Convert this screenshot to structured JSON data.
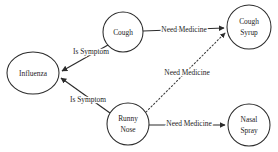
{
  "diagram": {
    "background_color": "#ffffff",
    "stroke_color": "#2b2b2b",
    "text_color": "#1d1d1d",
    "nodes": [
      {
        "id": "influenza",
        "label": "Influenza",
        "shape": "ellipse",
        "cx": 33,
        "cy": 73,
        "rx": 26,
        "ry": 21,
        "lines": [
          "Influenza"
        ]
      },
      {
        "id": "cough",
        "label": "Cough",
        "shape": "circle",
        "cx": 123,
        "cy": 32,
        "rx": 20,
        "ry": 20,
        "lines": [
          "Cough"
        ]
      },
      {
        "id": "runny-nose",
        "label": "Runny Nose",
        "shape": "circle",
        "cx": 128,
        "cy": 124,
        "rx": 21,
        "ry": 21,
        "lines": [
          "Runny",
          "Nose"
        ]
      },
      {
        "id": "cough-syrup",
        "label": "Cough Syrup",
        "shape": "circle",
        "cx": 249,
        "cy": 27,
        "rx": 22,
        "ry": 22,
        "lines": [
          "Cough",
          "Syrup"
        ]
      },
      {
        "id": "nasal-spray",
        "label": "Nasal Spray",
        "shape": "circle",
        "cx": 249,
        "cy": 125,
        "rx": 21,
        "ry": 21,
        "lines": [
          "Nasal",
          "Spray"
        ]
      }
    ],
    "edges": [
      {
        "id": "cough-to-influenza",
        "from": "cough",
        "to": "influenza",
        "label": "Is Symptom",
        "style": "solid",
        "arrow": true,
        "label_x": 91,
        "label_y": 52
      },
      {
        "id": "runny-nose-to-influenza",
        "from": "runny-nose",
        "to": "influenza",
        "label": "Is Symptom",
        "style": "solid",
        "arrow": true,
        "label_x": 88,
        "label_y": 100
      },
      {
        "id": "cough-to-cough-syrup",
        "from": "cough",
        "to": "cough-syrup",
        "label": "Need Medicine",
        "style": "solid",
        "arrow": true,
        "label_x": 184,
        "label_y": 30
      },
      {
        "id": "runny-nose-to-cough-syrup",
        "from": "runny-nose",
        "to": "cough-syrup",
        "label": "Need Medicine",
        "style": "dotted",
        "arrow": true,
        "label_x": 187,
        "label_y": 73
      },
      {
        "id": "runny-nose-to-nasal-spray",
        "from": "runny-nose",
        "to": "nasal-spray",
        "label": "Need Medicine",
        "style": "solid",
        "arrow": true,
        "label_x": 189,
        "label_y": 124
      }
    ]
  }
}
